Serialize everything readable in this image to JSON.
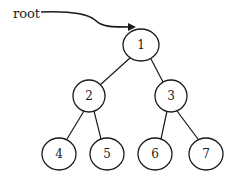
{
  "diagram": {
    "type": "binary-tree",
    "pointer_label": "root",
    "nodes": [
      {
        "id": "1",
        "label": "1",
        "cx": 141,
        "cy": 45
      },
      {
        "id": "2",
        "label": "2",
        "cx": 89,
        "cy": 96
      },
      {
        "id": "3",
        "label": "3",
        "cx": 171,
        "cy": 96
      },
      {
        "id": "4",
        "label": "4",
        "cx": 59,
        "cy": 154
      },
      {
        "id": "5",
        "label": "5",
        "cx": 107,
        "cy": 154
      },
      {
        "id": "6",
        "label": "6",
        "cx": 155,
        "cy": 154
      },
      {
        "id": "7",
        "label": "7",
        "cx": 206,
        "cy": 154
      }
    ],
    "edges": [
      {
        "from": "1",
        "to": "2"
      },
      {
        "from": "1",
        "to": "3"
      },
      {
        "from": "2",
        "to": "4"
      },
      {
        "from": "2",
        "to": "5"
      },
      {
        "from": "3",
        "to": "6"
      },
      {
        "from": "3",
        "to": "7"
      }
    ],
    "colors": {
      "stroke": "#1a1a1a",
      "background": "#ffffff"
    }
  }
}
